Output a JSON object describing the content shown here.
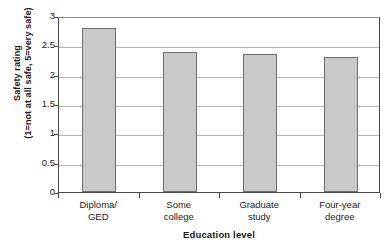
{
  "chart_data": {
    "type": "bar",
    "title": "",
    "categories": [
      "Diploma/ GED",
      "Some college",
      "Graduate study",
      "Four-year degree"
    ],
    "category_lines": [
      [
        "Diploma/",
        "GED"
      ],
      [
        "Some",
        "college"
      ],
      [
        "Graduate",
        "study"
      ],
      [
        "Four-year",
        "degree"
      ]
    ],
    "values": [
      2.8,
      2.38,
      2.36,
      2.3
    ],
    "xlabel": "Education level",
    "ylabel_line1": "Safety rating",
    "ylabel_line2": "(1=not at all safe, 5=very safe)",
    "ylim": [
      0,
      3
    ],
    "yticks": [
      "0",
      "0.5",
      "1",
      "1.5",
      "2",
      "2.5",
      "3"
    ],
    "ytick_values": [
      0,
      0.5,
      1,
      1.5,
      2,
      2.5,
      3
    ],
    "grid": true,
    "legend": "none",
    "bar_fill_color": "#c9c9c9",
    "bar_border_color": "#6e6e6e",
    "gridline_color": "#b5b5b5",
    "axis_color": "#4a4a4a"
  }
}
